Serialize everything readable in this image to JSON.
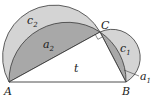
{
  "diagram": {
    "title": "",
    "points": {
      "A": {
        "label": "A",
        "x": 9,
        "y": 82
      },
      "B": {
        "label": "B",
        "x": 126,
        "y": 82
      },
      "C": {
        "label": "C",
        "x": 100,
        "y": 32
      }
    },
    "labels": {
      "c2": {
        "main": "c",
        "sub": "2"
      },
      "a2": {
        "main": "a",
        "sub": "2"
      },
      "c1": {
        "main": "c",
        "sub": "1"
      },
      "a1": {
        "main": "a",
        "sub": "1"
      },
      "t": "t",
      "A": "A",
      "B": "B",
      "C": "C"
    },
    "colors": {
      "lune_light": "#d4d4d4",
      "segment_dark": "#a8a8a8",
      "stroke": "#3a3a3a",
      "background": "#ffffff"
    }
  }
}
